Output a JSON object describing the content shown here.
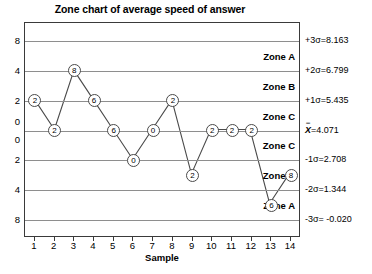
{
  "chart_data": {
    "type": "line",
    "title": "Zone chart of average speed of answer",
    "xlabel": "Sample",
    "ylabel": "",
    "grid": true,
    "legend": null,
    "x": [
      1,
      2,
      3,
      4,
      5,
      6,
      7,
      8,
      9,
      10,
      11,
      12,
      13,
      14
    ],
    "xtick_labels": [
      "1",
      "2",
      "3",
      "4",
      "5",
      "6",
      "7",
      "8",
      "9",
      "10",
      "11",
      "12",
      "13",
      "14"
    ],
    "ytick_labels": [
      "8",
      "4",
      "2",
      "0",
      "0",
      "2",
      "4",
      "8"
    ],
    "ytick_values": [
      3.0,
      2.0,
      1.0,
      0.3,
      -0.3,
      -1.0,
      -2.0,
      -3.0
    ],
    "ylim": [
      -3.6,
      3.6
    ],
    "values": [
      1.0,
      0.0,
      2.0,
      1.0,
      0.0,
      -1.0,
      0.0,
      1.0,
      -1.5,
      0.0,
      0.0,
      0.0,
      -2.5,
      -1.5
    ],
    "point_labels": [
      "2",
      "2",
      "8",
      "6",
      "6",
      "0",
      "0",
      "2",
      "2",
      "2",
      "2",
      "2",
      "6",
      "8"
    ],
    "zone_lines": [
      {
        "label": "+3σ=8.163",
        "value": 8.163,
        "pos": 3.0
      },
      {
        "label": "+2σ=6.799",
        "value": 6.799,
        "pos": 2.0
      },
      {
        "label": "+1σ=5.435",
        "value": 5.435,
        "pos": 1.0
      },
      {
        "label": "4.071",
        "value": 4.071,
        "pos": 0.0,
        "is_centerline": true,
        "prefix": "X"
      },
      {
        "label": "-1σ=2.708",
        "value": 2.708,
        "pos": -1.0
      },
      {
        "label": "-2σ=1.344",
        "value": 1.344,
        "pos": -2.0
      },
      {
        "label": "-3σ= -0.020",
        "value": -0.02,
        "pos": -3.0
      }
    ],
    "zone_bands": [
      {
        "label": "Zone A",
        "pos": 2.5
      },
      {
        "label": "Zone B",
        "pos": 1.5
      },
      {
        "label": "Zone C",
        "pos": 0.5
      },
      {
        "label": "Zone C",
        "pos": -0.5
      },
      {
        "label": "Zone B",
        "pos": -1.5
      },
      {
        "label": "Zone A",
        "pos": -2.5
      }
    ],
    "colors": {
      "line": "#4a4a4a",
      "gridline": "#8e8e8e",
      "frame": "#3a3a3a",
      "marker_fill": "#ffffff",
      "text": "#000000"
    }
  }
}
